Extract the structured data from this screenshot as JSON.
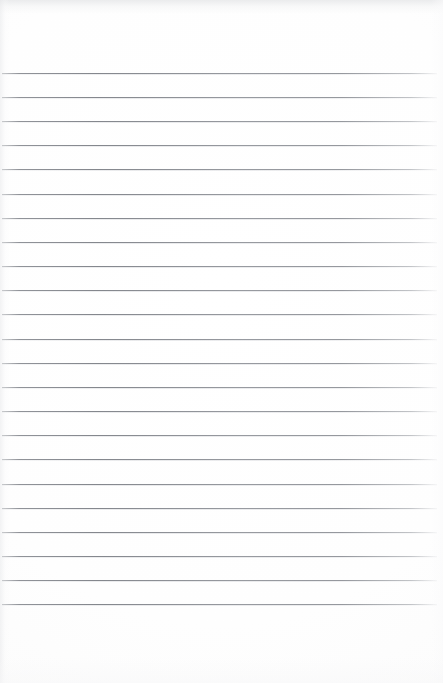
{
  "document": {
    "kind": "blank-ruled-notebook-paper",
    "description": "Scanned blank sheet of lined/ruled writing paper with no written content",
    "page_width_px": 443,
    "page_height_px": 683,
    "paper_color": "#fefefe",
    "rule_color": "#8a8d93",
    "written_text": "",
    "visible_text_items": []
  },
  "ruling": {
    "line_count": 23,
    "first_line_y": 73,
    "line_spacing_px": 24.15,
    "line_thickness_px": 1,
    "line_start_x": 2,
    "line_end_x": 437,
    "top_margin_px": 73,
    "bottom_margin_px": 79,
    "left_margin_px": 2,
    "right_margin_px": 6,
    "has_vertical_margin_rule": false,
    "lines": [
      {
        "index": 1,
        "y": 73,
        "x1": 2,
        "x2": 437
      },
      {
        "index": 2,
        "y": 97,
        "x1": 2,
        "x2": 437
      },
      {
        "index": 3,
        "y": 121,
        "x1": 2,
        "x2": 437
      },
      {
        "index": 4,
        "y": 145,
        "x1": 2,
        "x2": 437
      },
      {
        "index": 5,
        "y": 169,
        "x1": 2,
        "x2": 437
      },
      {
        "index": 6,
        "y": 194,
        "x1": 2,
        "x2": 437
      },
      {
        "index": 7,
        "y": 218,
        "x1": 2,
        "x2": 437
      },
      {
        "index": 8,
        "y": 242,
        "x1": 2,
        "x2": 437
      },
      {
        "index": 9,
        "y": 266,
        "x1": 2,
        "x2": 437
      },
      {
        "index": 10,
        "y": 290,
        "x1": 2,
        "x2": 437
      },
      {
        "index": 11,
        "y": 314,
        "x1": 2,
        "x2": 437
      },
      {
        "index": 12,
        "y": 339,
        "x1": 2,
        "x2": 437
      },
      {
        "index": 13,
        "y": 363,
        "x1": 2,
        "x2": 437
      },
      {
        "index": 14,
        "y": 387,
        "x1": 2,
        "x2": 437
      },
      {
        "index": 15,
        "y": 411,
        "x1": 2,
        "x2": 437
      },
      {
        "index": 16,
        "y": 435,
        "x1": 2,
        "x2": 437
      },
      {
        "index": 17,
        "y": 459,
        "x1": 2,
        "x2": 437
      },
      {
        "index": 18,
        "y": 484,
        "x1": 2,
        "x2": 437
      },
      {
        "index": 19,
        "y": 508,
        "x1": 2,
        "x2": 437
      },
      {
        "index": 20,
        "y": 532,
        "x1": 2,
        "x2": 437
      },
      {
        "index": 21,
        "y": 556,
        "x1": 2,
        "x2": 437
      },
      {
        "index": 22,
        "y": 580,
        "x1": 2,
        "x2": 437
      },
      {
        "index": 23,
        "y": 604,
        "x1": 2,
        "x2": 437
      }
    ]
  },
  "shading": {
    "top_band_color": "#e4e5e7",
    "left_edge_color": "#e8e9eb",
    "bottom_edge_color": "#f7f7f8",
    "right_edge_color": "#fafafb"
  }
}
